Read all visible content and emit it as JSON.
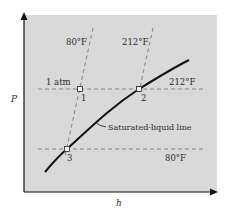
{
  "diagram": {
    "axes": {
      "y_label": "P",
      "x_label": "h"
    },
    "isobar_labels": {
      "upper_left": "1 atm",
      "upper_right": "212°F",
      "lower_right": "80°F"
    },
    "isotherm_labels": {
      "left": "80°F",
      "right": "212°F"
    },
    "points": [
      {
        "label": "1"
      },
      {
        "label": "2"
      },
      {
        "label": "3"
      }
    ],
    "curve_label": "Saturated-liquid line",
    "colors": {
      "plot_background": "#d9d9d9",
      "curve": "#111111",
      "dashed": "#7a7a7a",
      "axis": "#111111"
    }
  }
}
